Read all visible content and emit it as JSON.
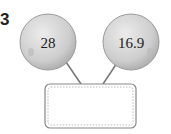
{
  "problem_number": "3",
  "left_ball": {
    "value": "28"
  },
  "right_ball": {
    "value": "16.9"
  },
  "answer_box": {
    "value": ""
  },
  "colors": {
    "ball_fill": "#cfcfcf",
    "ball_edge": "#9a9a9a",
    "line": "#777777",
    "box_border": "#888888"
  }
}
